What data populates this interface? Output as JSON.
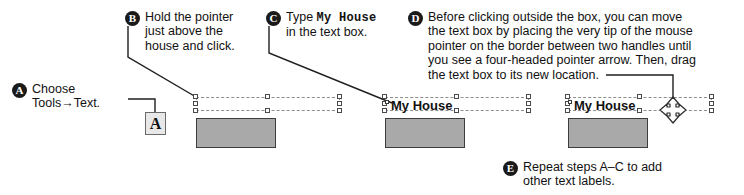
{
  "figure": {
    "callouts": [
      {
        "id": "A",
        "letter": "A",
        "text": "Choose\nTools→Text."
      },
      {
        "id": "B",
        "letter": "B",
        "text": "Hold the pointer\njust above the\nhouse and click."
      },
      {
        "id": "C",
        "letter": "C",
        "lead": "Type ",
        "mono": "My House",
        "tail": "\nin the text box."
      },
      {
        "id": "D",
        "letter": "D",
        "text": "Before clicking outside the box, you can move\nthe text box by placing the very tip of the mouse\npointer on the border between two handles until\nyou see a four-headed pointer arrow. Then, drag\nthe text box to its new location."
      },
      {
        "id": "E",
        "letter": "E",
        "text": "Repeat steps A–C to add\nother text labels."
      }
    ],
    "tool_icon": {
      "label": "A",
      "name": "text-tool-icon"
    },
    "canvas": {
      "text_box_label": "My House",
      "stage_1_label": "",
      "stage_2_label": "My House",
      "stage_3_label": "My House"
    },
    "colors": {
      "house_fill": "#a9a9a9",
      "house_stroke": "#3d3d3d",
      "selection_dash": "#8d8d8d",
      "handle_fill": "#ffffff",
      "handle_stroke": "#4a4a4a",
      "bullet_bg": "#1a1a1a",
      "bullet_fg": "#ffffff",
      "leader_line": "#1f1f1f",
      "text": "#111111"
    }
  }
}
